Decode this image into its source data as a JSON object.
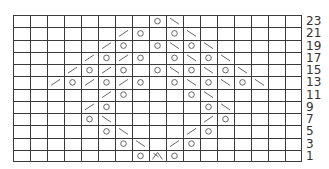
{
  "chart_data": {
    "type": "table",
    "title": "",
    "columns": 17,
    "rows_top_to_bottom": [
      23,
      21,
      19,
      17,
      15,
      13,
      11,
      9,
      7,
      5,
      3,
      1
    ],
    "legend_symbols": {
      "O": "yarn-over",
      "/": "k2tog (right-leaning decrease)",
      "\\": "ssk (left-leaning decrease)",
      "A": "centered double decrease",
      "": "knit"
    },
    "cells": {
      "23": {
        "8": "O",
        "9": "\\"
      },
      "21": {
        "6": "/",
        "7": "O",
        "9": "O",
        "10": "\\"
      },
      "19": {
        "5": "/",
        "6": "O",
        "8": "O",
        "9": "\\",
        "10": "O",
        "11": "\\"
      },
      "17": {
        "4": "/",
        "5": "O",
        "6": "/",
        "7": "O",
        "9": "O",
        "10": "\\",
        "11": "O",
        "12": "\\"
      },
      "15": {
        "3": "/",
        "4": "O",
        "5": "/",
        "6": "O",
        "8": "O",
        "9": "\\",
        "10": "O",
        "11": "\\",
        "12": "O",
        "13": "\\"
      },
      "13": {
        "2": "/",
        "3": "O",
        "4": "/",
        "5": "O",
        "6": "/",
        "7": "O",
        "9": "O",
        "10": "\\",
        "11": "O",
        "12": "\\",
        "13": "O",
        "14": "\\"
      },
      "11": {
        "5": "/",
        "6": "O",
        "10": "O",
        "11": "\\"
      },
      "9": {
        "4": "/",
        "5": "O",
        "11": "O",
        "12": "\\"
      },
      "7": {
        "4": "O",
        "5": "\\",
        "11": "/",
        "12": "O"
      },
      "5": {
        "5": "O",
        "6": "\\",
        "10": "/",
        "11": "O"
      },
      "3": {
        "6": "O",
        "7": "\\",
        "9": "/",
        "10": "O"
      },
      "1": {
        "7": "O",
        "8": "A",
        "9": "O"
      }
    },
    "row_labels": [
      "23",
      "21",
      "19",
      "17",
      "15",
      "13",
      "11",
      "9",
      "7",
      "5",
      "3",
      "1"
    ],
    "label_position": "right"
  },
  "colors": {
    "grid_line": "#3a3a3a",
    "symbol": "#555555",
    "label": "#333333",
    "background": "#ffffff"
  }
}
